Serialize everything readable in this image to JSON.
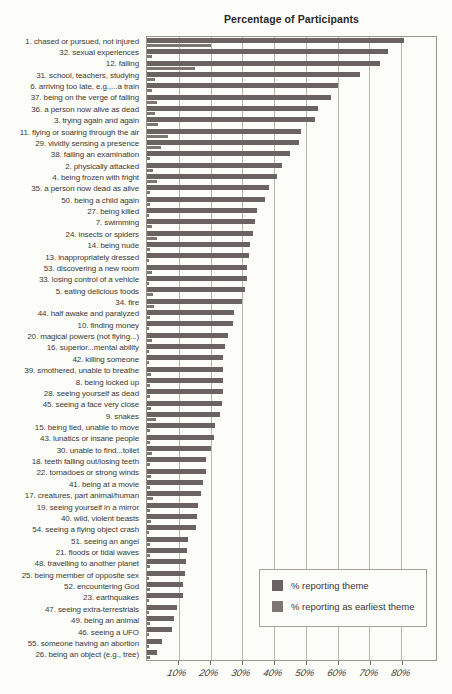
{
  "title": "Percentage of Participants",
  "legend": {
    "series1": "% reporting theme",
    "series2": "% reporting as earliest theme"
  },
  "colors": {
    "main_bar": "#6b6361",
    "early_bar": "#7d7673",
    "gridline": "#b7b7af",
    "plot_border": "#96968e",
    "background": "#fcfcf9",
    "text": "#403a35"
  },
  "x_ticks": [
    "10%",
    "20%",
    "30%",
    "40%",
    "50%",
    "60%",
    "70%",
    "80%"
  ],
  "chart_data": {
    "type": "bar",
    "orientation": "horizontal",
    "title": "Percentage of Participants",
    "xlabel": "Percentage of Participants",
    "ylabel": "",
    "xlim": [
      0,
      91
    ],
    "grid": true,
    "legend_position": "inside-bottom-right",
    "categories": [
      "1. chased or pursued, not injured",
      "32. sexual experiences",
      "12. falling",
      "31. school, teachers, studying",
      "6. arriving too late, e.g.,...a train",
      "37. being on the verge of falling",
      "36. a person now alive as dead",
      "3. trying again and again",
      "11. flying or soaring through the air",
      "29. vividly sensing a presence",
      "38. failing an examination",
      "2. physically attacked",
      "4. being frozen with fright",
      "35. a person now dead as alive",
      "50. being a child again",
      "27. being killed",
      "7. swimming",
      "24. insects or spiders",
      "14. being nude",
      "13. inappropriately dressed",
      "53. discovering a new room",
      "33. losing control of a vehicle",
      "5. eating delicious foods",
      "34. fire",
      "44. half awake and paralyzed",
      "10. finding money",
      "20. magical powers (not flying...)",
      "16. superior...mental ability",
      "42. killing someone",
      "39. smothered, unable to breathe",
      "8. being locked up",
      "28. seeing yourself as dead",
      "45. seeing a face very close",
      "9. snakes",
      "15. being tied, unable to move",
      "43. lunatics or insane people",
      "30. unable to find...toilet",
      "18. teeth falling out/losing teeth",
      "22. tornadoes or strong winds",
      "41. being at a movie",
      "17. creatures, part animal/human",
      "19. seeing yourself in a mirror",
      "40. wild, violent beasts",
      "54. seeing a flying object crash",
      "51. seeing an angel",
      "21. floods or tidal waves",
      "48. travelling to another planet",
      "25. being member of opposite sex",
      "52. encountering God",
      "23. earthquakes",
      "47. seeing extra-terrestrials",
      "49. being an animal",
      "46. seeing a UFO",
      "55. someone having an abortion",
      "26. being an object (e.g., tree)"
    ],
    "series": [
      {
        "name": "% reporting theme",
        "values": [
          81,
          76,
          73.5,
          67,
          60,
          58,
          54,
          53,
          48.5,
          48,
          45,
          42.5,
          41,
          38.5,
          37,
          34.5,
          34,
          33.5,
          32.5,
          32,
          31.5,
          31.5,
          31,
          30,
          27.5,
          27,
          25.5,
          24.5,
          24,
          24,
          24,
          24,
          23.5,
          23,
          21.5,
          21,
          20,
          18.5,
          18.5,
          17.5,
          17,
          16,
          15.7,
          15.5,
          12.8,
          12.6,
          12.4,
          12,
          11.4,
          11.2,
          9.6,
          8.4,
          8,
          4.8,
          3
        ]
      },
      {
        "name": "% reporting as earliest theme",
        "values": [
          20,
          1.5,
          15,
          2.5,
          1.5,
          3,
          2.5,
          3.5,
          6.5,
          4.5,
          1,
          2,
          3,
          1,
          0.8,
          0.6,
          1.5,
          3.3,
          0.8,
          0.5,
          1.6,
          0.5,
          1.8,
          2.3,
          1,
          0.5,
          1.6,
          0.5,
          0.5,
          1.3,
          1,
          0.8,
          1.3,
          2.8,
          1,
          1,
          1.5,
          1,
          1.3,
          0.8,
          1.9,
          1,
          1.3,
          0.5,
          0.8,
          1,
          0.8,
          0.5,
          0.8,
          0.5,
          0.5,
          0.8,
          0.5,
          0.5,
          0.8
        ]
      }
    ]
  }
}
